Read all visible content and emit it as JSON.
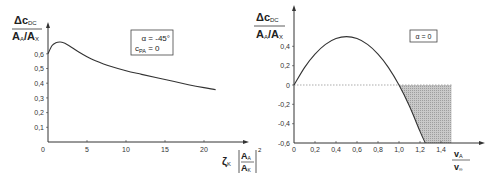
{
  "chart_data": [
    {
      "type": "line",
      "title": "",
      "ylabel": "Δc_DC / (A_A/A_X)",
      "ylabel_num": "Δc",
      "ylabel_num_sub": "DC",
      "ylabel_den": "A",
      "ylabel_den_sub1": "A",
      "ylabel_den_mid": "/A",
      "ylabel_den_sub2": "X",
      "xlabel": "ζ_K [A_A/A_K]^2",
      "xlabel_symbol": "ζ",
      "xlabel_sub": "K",
      "xlabel_frac_num": "A",
      "xlabel_frac_num_sub": "A",
      "xlabel_frac_den": "A",
      "xlabel_frac_den_sub": "K",
      "xlabel_exp": "2",
      "xlim": [
        0,
        25
      ],
      "ylim": [
        0,
        0.75
      ],
      "x_ticks": [
        "0",
        "5",
        "10",
        "15",
        "20"
      ],
      "y_ticks": [
        "0,1",
        "0,2",
        "0,3",
        "0,4",
        "0,5",
        "0,6"
      ],
      "grid": false,
      "annotation": {
        "line1": "α = -45°",
        "line2_main": "c",
        "line2_sub": "PA",
        "line2_rest": " = 0"
      },
      "series": [
        {
          "name": "Δc_DC",
          "x": [
            0,
            0.5,
            1,
            1.5,
            2,
            3,
            4,
            5,
            6,
            8,
            10,
            12,
            15,
            18,
            20,
            21.5
          ],
          "y": [
            0.6,
            0.655,
            0.675,
            0.68,
            0.675,
            0.645,
            0.61,
            0.58,
            0.555,
            0.515,
            0.485,
            0.46,
            0.425,
            0.39,
            0.37,
            0.355
          ]
        }
      ]
    },
    {
      "type": "line",
      "title": "",
      "ylabel": "Δc_DC / (A_A/A_X)",
      "ylabel_num": "Δc",
      "ylabel_num_sub": "DC",
      "ylabel_den": "A",
      "ylabel_den_sub1": "A",
      "ylabel_den_mid": "/A",
      "ylabel_den_sub2": "X",
      "xlabel": "v_A / v_∞",
      "xlabel_num": "v",
      "xlabel_num_sub": "A",
      "xlabel_den": "v",
      "xlabel_den_sub": "∞",
      "xlim": [
        0,
        1.7
      ],
      "ylim": [
        -0.6,
        0.6
      ],
      "x_ticks": [
        "0",
        "0,2",
        "0,4",
        "0,6",
        "0,8",
        "1,0",
        "1,2",
        "1,4"
      ],
      "y_ticks": [
        "0,4",
        "0,2",
        "0",
        "-0,2",
        "-0,4",
        "-0,6"
      ],
      "grid": false,
      "annotation": {
        "line1": "α = 0"
      },
      "shaded_region": {
        "x_from": 1.0,
        "x_to": 1.5,
        "y_from": -0.6,
        "y_to": 0,
        "bounded_by": "curve"
      },
      "series": [
        {
          "name": "Δc_DC",
          "x": [
            0,
            0.1,
            0.2,
            0.3,
            0.4,
            0.5,
            0.6,
            0.7,
            0.8,
            0.9,
            1.0,
            1.1,
            1.2,
            1.25
          ],
          "y": [
            0,
            0.18,
            0.32,
            0.42,
            0.48,
            0.5,
            0.48,
            0.42,
            0.32,
            0.18,
            0,
            -0.22,
            -0.48,
            -0.6
          ]
        }
      ]
    }
  ]
}
